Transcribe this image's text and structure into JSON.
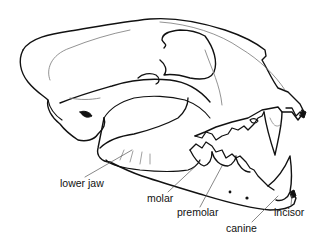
{
  "diagram": {
    "labels": {
      "lower_jaw": "lower jaw",
      "molar": "molar",
      "premolar": "premolar",
      "canine": "canine",
      "incisor": "incisor"
    }
  },
  "colors": {
    "line": "#111111",
    "background": "#ffffff"
  }
}
